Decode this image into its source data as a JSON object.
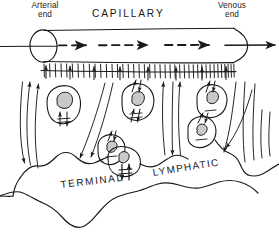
{
  "figure": {
    "title": "CAPILLARY",
    "caption": "Fluid filtration from capillary into interstitium and uptake by terminal lymphatic",
    "width": 279,
    "height": 240,
    "background": "#ffffff",
    "ink_color": "#1a1a1a",
    "nucleus_fill": "#c9c9c9"
  },
  "labels": {
    "arterial_end_line1": "Arterial",
    "arterial_end_line2": "end",
    "venous_end_line1": "Venous",
    "venous_end_line2": "end",
    "capillary": "CAPILLARY",
    "terminal": "TERMINAL",
    "lymphatic": "LYMPHATIC"
  },
  "diagram_data": {
    "type": "schematic-biological-diagram",
    "structures": [
      {
        "name": "capillary-tube",
        "description": "Horizontal cylindrical vessel spanning the top of the figure, open ellipse at arterial (left) end and rounded cap at venous (right) end",
        "x_start": 38,
        "x_end": 248,
        "y_center": 46
      },
      {
        "name": "capillary-wall-hatching",
        "description": "Row of short vertical tick marks along the underside of the capillary representing the endothelial wall; tick density increases toward the venous end",
        "tick_count": 44
      },
      {
        "name": "terminal-lymphatic",
        "description": "Large irregular wavy-bordered lymphatic channel occupying the lower half of the figure"
      },
      {
        "name": "interstitial-cells",
        "description": "Six oval tissue cells with shaded nuclei distributed in the interstitial space between capillary and lymphatic",
        "count": 6
      }
    ],
    "flow_arrows": [
      {
        "name": "axial-blood-flow",
        "style": "dashed with solid arrowhead",
        "direction": "left-to-right",
        "count": 3,
        "meaning": "Blood flow from arterial end to venous end"
      },
      {
        "name": "transcapillary-filtration",
        "style": "short solid vertical arrows crossing the capillary wall",
        "direction": "downward and upward across wall",
        "meaning": "Filtration out of and reabsorption into the capillary"
      },
      {
        "name": "interstitial-convection",
        "style": "long slender curved lines with arrowheads at both ends",
        "direction": "vertical, downward into lymphatic and upward toward capillary",
        "count": 8,
        "meaning": "Bulk interstitial fluid movement toward the terminal lymphatic"
      },
      {
        "name": "pericellular-exchange",
        "style": "paired short parallel arrows (up and down) beside each cell",
        "count": 6,
        "meaning": "Fluid and solute exchange around tissue cells"
      }
    ]
  }
}
